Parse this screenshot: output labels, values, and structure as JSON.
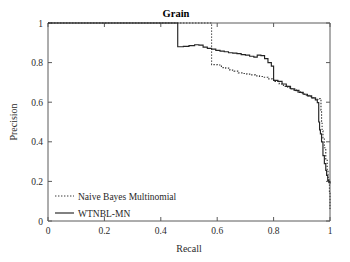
{
  "chart_data": {
    "type": "line",
    "title": "Grain",
    "xlabel": "Recall",
    "ylabel": "Precision",
    "xlim": [
      0,
      1
    ],
    "ylim": [
      0,
      1
    ],
    "grid": false,
    "legend_position": "lower-left-inside",
    "xticks": [
      "0",
      "0.2",
      "0.4",
      "0.6",
      "0.8",
      "1"
    ],
    "xtick_values": [
      0,
      0.2,
      0.4,
      0.6,
      0.8,
      1
    ],
    "yticks": [
      "0",
      "0.2",
      "0.4",
      "0.6",
      "0.8",
      "1"
    ],
    "ytick_values": [
      0,
      0.2,
      0.4,
      0.6,
      0.8,
      1
    ],
    "series": [
      {
        "name": "Naive Bayes Multinomial",
        "style": "dotted",
        "color": "#3a3a3a",
        "points": [
          [
            0.0,
            1.0
          ],
          [
            0.58,
            1.0
          ],
          [
            0.58,
            0.79
          ],
          [
            0.6,
            0.788
          ],
          [
            0.615,
            0.775
          ],
          [
            0.63,
            0.772
          ],
          [
            0.645,
            0.762
          ],
          [
            0.66,
            0.757
          ],
          [
            0.675,
            0.748
          ],
          [
            0.69,
            0.745
          ],
          [
            0.705,
            0.742
          ],
          [
            0.72,
            0.738
          ],
          [
            0.735,
            0.733
          ],
          [
            0.75,
            0.73
          ],
          [
            0.765,
            0.726
          ],
          [
            0.78,
            0.718
          ],
          [
            0.795,
            0.712
          ],
          [
            0.805,
            0.705
          ],
          [
            0.82,
            0.692
          ],
          [
            0.835,
            0.68
          ],
          [
            0.85,
            0.672
          ],
          [
            0.865,
            0.662
          ],
          [
            0.88,
            0.652
          ],
          [
            0.895,
            0.645
          ],
          [
            0.91,
            0.635
          ],
          [
            0.925,
            0.628
          ],
          [
            0.94,
            0.62
          ],
          [
            0.95,
            0.615
          ],
          [
            0.958,
            0.618
          ],
          [
            0.965,
            0.612
          ],
          [
            0.968,
            0.56
          ],
          [
            0.97,
            0.5
          ],
          [
            0.972,
            0.455
          ],
          [
            0.975,
            0.42
          ],
          [
            0.98,
            0.37
          ],
          [
            0.985,
            0.31
          ],
          [
            0.99,
            0.255
          ],
          [
            0.993,
            0.22
          ],
          [
            0.996,
            0.19
          ],
          [
            0.998,
            0.15
          ],
          [
            1.0,
            0.06
          ]
        ]
      },
      {
        "name": "WTNBL-MN",
        "style": "solid",
        "color": "#242424",
        "points": [
          [
            0.0,
            1.0
          ],
          [
            0.46,
            1.0
          ],
          [
            0.46,
            0.88
          ],
          [
            0.48,
            0.882
          ],
          [
            0.5,
            0.886
          ],
          [
            0.52,
            0.89
          ],
          [
            0.535,
            0.888
          ],
          [
            0.55,
            0.878
          ],
          [
            0.565,
            0.872
          ],
          [
            0.58,
            0.868
          ],
          [
            0.595,
            0.862
          ],
          [
            0.61,
            0.858
          ],
          [
            0.625,
            0.855
          ],
          [
            0.64,
            0.85
          ],
          [
            0.655,
            0.848
          ],
          [
            0.67,
            0.845
          ],
          [
            0.685,
            0.84
          ],
          [
            0.7,
            0.838
          ],
          [
            0.715,
            0.832
          ],
          [
            0.73,
            0.828
          ],
          [
            0.742,
            0.838
          ],
          [
            0.755,
            0.835
          ],
          [
            0.768,
            0.82
          ],
          [
            0.78,
            0.8
          ],
          [
            0.792,
            0.782
          ],
          [
            0.8,
            0.71
          ],
          [
            0.815,
            0.705
          ],
          [
            0.83,
            0.692
          ],
          [
            0.845,
            0.68
          ],
          [
            0.86,
            0.668
          ],
          [
            0.875,
            0.66
          ],
          [
            0.89,
            0.65
          ],
          [
            0.905,
            0.64
          ],
          [
            0.92,
            0.632
          ],
          [
            0.935,
            0.622
          ],
          [
            0.948,
            0.612
          ],
          [
            0.955,
            0.598
          ],
          [
            0.96,
            0.5
          ],
          [
            0.963,
            0.46
          ],
          [
            0.966,
            0.44
          ],
          [
            0.97,
            0.4
          ],
          [
            0.975,
            0.33
          ],
          [
            0.98,
            0.29
          ],
          [
            0.985,
            0.255
          ],
          [
            0.988,
            0.23
          ],
          [
            0.992,
            0.205
          ],
          [
            0.996,
            0.198
          ],
          [
            1.0,
            0.19
          ]
        ]
      }
    ]
  },
  "legend": {
    "entries": [
      {
        "label": "Naive Bayes Multinomial",
        "style": "dotted"
      },
      {
        "label": "WTNBL-MN",
        "style": "solid"
      }
    ]
  }
}
